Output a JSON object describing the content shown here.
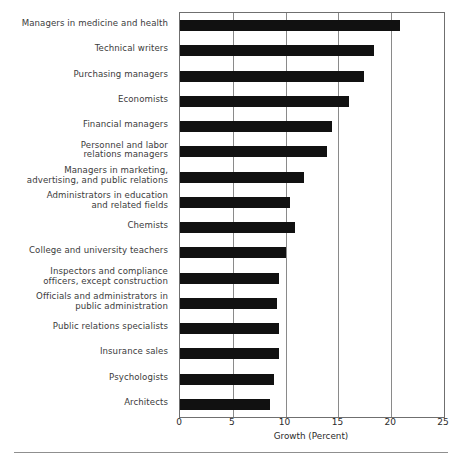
{
  "chart_data": {
    "type": "bar",
    "orientation": "horizontal",
    "title": "",
    "xlabel": "Growth (Percent)",
    "ylabel": "",
    "xlim": [
      0,
      25
    ],
    "xticks": [
      0,
      5,
      10,
      15,
      20,
      25
    ],
    "xtick_labels": [
      "0",
      "5",
      "10",
      "15",
      "20",
      "25"
    ],
    "grid": "vertical gridlines at 5, 10, 15, 20",
    "legend": "none",
    "bar_color": "#111111",
    "categories": [
      "Managers in medicine and health",
      "Technical writers",
      "Purchasing managers",
      "Economists",
      "Financial managers",
      "Personnel and labor\nrelations managers",
      "Managers in marketing,\nadvertising, and public relations",
      "Administrators in education\nand related fields",
      "Chemists",
      "College and university teachers",
      "Inspectors and compliance\nofficers, except construction",
      "Officials and administrators in\npublic administration",
      "Public relations specialists",
      "Insurance sales",
      "Psychologists",
      "Architects"
    ],
    "values": [
      20.8,
      18.4,
      17.4,
      16.0,
      14.4,
      13.9,
      11.7,
      10.4,
      10.9,
      10.0,
      9.4,
      9.2,
      9.4,
      9.4,
      8.9,
      8.5
    ]
  },
  "axis": {
    "title": "Growth (Percent)"
  },
  "colors": {
    "bar": "#111111",
    "frame": "#6f6f6f",
    "gridline": "#8a8a8a",
    "label_text": "#3b3b3b",
    "footer_rule": "#8f8f8f"
  }
}
